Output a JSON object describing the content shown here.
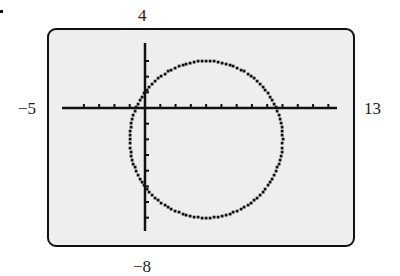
{
  "figure": {
    "marker": "•",
    "window_labels": {
      "ymax": "4",
      "xmin": "−5",
      "xmax": "13",
      "ymin": "−8"
    }
  },
  "chart_data": {
    "type": "graphing-calculator-window",
    "title": "",
    "window": {
      "xmin": -5,
      "xmax": 13,
      "ymin": -8,
      "ymax": 4,
      "xscl": 1,
      "yscl": 1
    },
    "axes_ticks": {
      "x_tick_spacing": 1,
      "y_tick_spacing": 1
    },
    "curve": {
      "kind": "circle",
      "estimated_center": [
        4,
        -2
      ],
      "estimated_radius": 5,
      "estimate_basis": "read from pixel positions against the axis window; no equation or values are printed in the figure"
    },
    "grid": false,
    "legend": null
  }
}
